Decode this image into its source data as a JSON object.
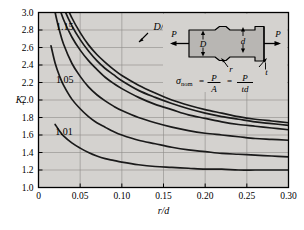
{
  "chart_data": {
    "type": "line",
    "title": "",
    "xlabel": "r/d",
    "ylabel": "K_t",
    "xlim": [
      0,
      0.3
    ],
    "ylim": [
      1.0,
      3.0
    ],
    "grid": true,
    "xticks": [
      "0",
      "0.05",
      "0.10",
      "0.15",
      "0.20",
      "0.25",
      "0.30"
    ],
    "xtick_values": [
      0,
      0.05,
      0.1,
      0.15,
      0.2,
      0.25,
      0.3
    ],
    "yticks": [
      "1.0",
      "1.2",
      "1.4",
      "1.6",
      "1.8",
      "2.0",
      "2.2",
      "2.4",
      "2.6",
      "2.8",
      "3.0"
    ],
    "ytick_values": [
      1.0,
      1.2,
      1.4,
      1.6,
      1.8,
      2.0,
      2.2,
      2.4,
      2.6,
      2.8,
      3.0
    ],
    "legend_position": "inline-curve-labels",
    "series": [
      {
        "name": "D/d = 3.0",
        "label": "3.0",
        "label_x": 0.152,
        "label_y": 2.3,
        "x": [
          0.02,
          0.03,
          0.04,
          0.05,
          0.06,
          0.07,
          0.08,
          0.09,
          0.1,
          0.12,
          0.14,
          0.16,
          0.18,
          0.2,
          0.22,
          0.24,
          0.26,
          0.28,
          0.3
        ],
        "y": [
          3.48,
          3.16,
          2.94,
          2.77,
          2.63,
          2.52,
          2.43,
          2.35,
          2.28,
          2.17,
          2.08,
          2.0,
          1.94,
          1.89,
          1.85,
          1.81,
          1.78,
          1.76,
          1.74
        ]
      },
      {
        "name": "D/d = 2",
        "label": "D/d = 2",
        "label_x": 0.138,
        "label_y": 2.8,
        "x": [
          0.02,
          0.03,
          0.04,
          0.05,
          0.06,
          0.07,
          0.08,
          0.09,
          0.1,
          0.12,
          0.14,
          0.16,
          0.18,
          0.2,
          0.22,
          0.24,
          0.26,
          0.28,
          0.3
        ],
        "y": [
          3.36,
          3.06,
          2.85,
          2.69,
          2.56,
          2.45,
          2.36,
          2.29,
          2.22,
          2.11,
          2.03,
          1.96,
          1.9,
          1.85,
          1.81,
          1.78,
          1.75,
          1.73,
          1.71
        ]
      },
      {
        "name": "D/d = 1.5",
        "label": "1.5",
        "label_x": 0.193,
        "label_y": 2.44,
        "x": [
          0.02,
          0.03,
          0.04,
          0.05,
          0.06,
          0.07,
          0.08,
          0.09,
          0.1,
          0.12,
          0.14,
          0.16,
          0.18,
          0.2,
          0.22,
          0.24,
          0.26,
          0.28,
          0.3
        ],
        "y": [
          3.2,
          2.92,
          2.72,
          2.57,
          2.45,
          2.35,
          2.26,
          2.19,
          2.13,
          2.03,
          1.95,
          1.89,
          1.83,
          1.79,
          1.75,
          1.72,
          1.7,
          1.68,
          1.66
        ]
      },
      {
        "name": "D/d = 1.15",
        "label": "1.15",
        "label_x": 0.021,
        "label_y": 2.8,
        "x": [
          0.015,
          0.02,
          0.025,
          0.03,
          0.04,
          0.05,
          0.06,
          0.07,
          0.08,
          0.09,
          0.1,
          0.12,
          0.14,
          0.16,
          0.18,
          0.2,
          0.22,
          0.24,
          0.26,
          0.28,
          0.3
        ],
        "y": [
          3.28,
          3.0,
          2.8,
          2.64,
          2.42,
          2.27,
          2.15,
          2.06,
          1.99,
          1.93,
          1.88,
          1.8,
          1.74,
          1.69,
          1.65,
          1.62,
          1.6,
          1.58,
          1.56,
          1.55,
          1.54
        ]
      },
      {
        "name": "D/d = 1.05",
        "label": "1.05",
        "label_x": 0.021,
        "label_y": 2.2,
        "x": [
          0.015,
          0.02,
          0.025,
          0.03,
          0.04,
          0.05,
          0.06,
          0.07,
          0.08,
          0.09,
          0.1,
          0.12,
          0.14,
          0.16,
          0.18,
          0.2,
          0.22,
          0.24,
          0.26,
          0.28,
          0.3
        ],
        "y": [
          2.62,
          2.42,
          2.28,
          2.17,
          2.01,
          1.9,
          1.81,
          1.74,
          1.69,
          1.64,
          1.6,
          1.54,
          1.5,
          1.46,
          1.43,
          1.41,
          1.39,
          1.38,
          1.37,
          1.36,
          1.35
        ]
      },
      {
        "name": "D/d = 1.01",
        "label": "1.01",
        "label_x": 0.02,
        "label_y": 1.6,
        "x": [
          0.02,
          0.025,
          0.03,
          0.04,
          0.05,
          0.06,
          0.07,
          0.08,
          0.09,
          0.1,
          0.12,
          0.14,
          0.16,
          0.18,
          0.2,
          0.22,
          0.24,
          0.26,
          0.28,
          0.3
        ],
        "y": [
          1.72,
          1.65,
          1.59,
          1.51,
          1.45,
          1.4,
          1.36,
          1.33,
          1.31,
          1.29,
          1.26,
          1.24,
          1.23,
          1.22,
          1.21,
          1.21,
          1.2,
          1.2,
          1.2,
          1.2
        ]
      }
    ]
  },
  "inset": {
    "force_left_label": "P",
    "force_right_label": "P",
    "large_width_label": "D",
    "small_width_label": "d",
    "radius_label": "r",
    "thickness_label": "t",
    "formula_sigma": "σ",
    "formula_sigma_sub": "nom",
    "formula_eq1": "=",
    "formula_num1": "P",
    "formula_den1": "A",
    "formula_eq2": "=",
    "formula_num2": "P",
    "formula_den2": "td"
  },
  "style": {
    "plot_background": "#d4d2cf",
    "curve_color": "#1a1a1a",
    "grid_color": "#8d8b88",
    "inset_fill": "#b8b6b3",
    "inset_panel": "#d4d2cf"
  }
}
